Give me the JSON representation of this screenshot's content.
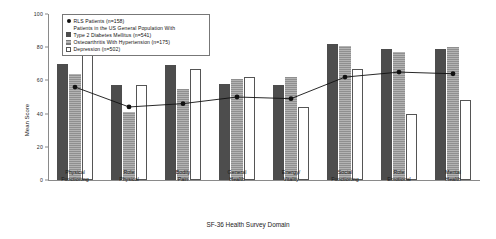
{
  "chart_data": {
    "type": "bar",
    "title": "",
    "xlabel": "SF-36 Health Survey Domain",
    "ylabel": "Mean Score",
    "ylim": [
      0,
      100
    ],
    "yticks": [
      0,
      20,
      40,
      60,
      80,
      100
    ],
    "grid": false,
    "legend_position": "top-left-inset",
    "categories": [
      "Physical Functioning",
      "Role Physical",
      "Bodily Pain",
      "General Health",
      "Energy/ Vitality",
      "Social Functioning",
      "Role Emotional",
      "Mental Health"
    ],
    "category_lines": [
      [
        "Physical",
        "Functioning"
      ],
      [
        "Role",
        "Physical"
      ],
      [
        "Bodily",
        "Pain"
      ],
      [
        "General",
        "Health"
      ],
      [
        "Energy/",
        "Vitality"
      ],
      [
        "Social",
        "Functioning"
      ],
      [
        "Role",
        "Emotional"
      ],
      [
        "Mental",
        "Health"
      ]
    ],
    "series": [
      {
        "name": "RLS Patients (n=158)",
        "kind": "line",
        "color": "#111111",
        "values": [
          56,
          44,
          46,
          50,
          49,
          62,
          65,
          64
        ]
      },
      {
        "name": "Type 2 Diabetes Mellitus (n=541)",
        "kind": "bar",
        "color": "#4d4d4d",
        "values": [
          70,
          57,
          69,
          58,
          57,
          82,
          79,
          79
        ]
      },
      {
        "name": "Osteoarthritis With Hypertension (n=175)",
        "kind": "bar",
        "color": "#b3b3b3",
        "values": [
          64,
          41,
          55,
          61,
          62,
          81,
          77,
          80
        ]
      },
      {
        "name": "Depression (n=502)",
        "kind": "bar",
        "color": "#ffffff",
        "values": [
          78,
          57,
          67,
          62,
          44,
          67,
          40,
          48
        ]
      }
    ]
  },
  "legend": {
    "rows": [
      {
        "key": "marker",
        "label": "RLS Patients (n=158)",
        "indent": false
      },
      {
        "key": "none",
        "label": "Patients in the US General Population With",
        "indent": true
      },
      {
        "key": "diabetes",
        "label": "Type 2 Diabetes Mellitus (n=541)",
        "indent": false
      },
      {
        "key": "osteo",
        "label": "Osteoarthritis With Hypertension (n=175)",
        "indent": false
      },
      {
        "key": "depression",
        "label": "Depression (n=502)",
        "indent": false
      }
    ]
  }
}
